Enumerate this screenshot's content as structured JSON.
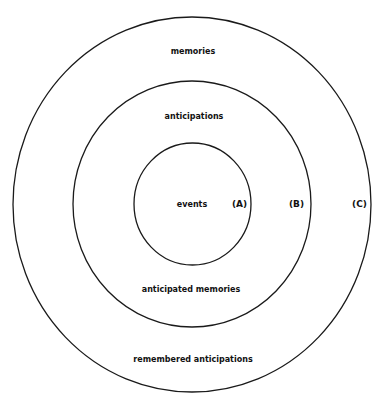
{
  "diagram": {
    "type": "concentric-circles",
    "colors": {
      "stroke": "#1a1a1a",
      "text": "#111111",
      "background": "#ffffff"
    },
    "circles": [
      {
        "id": "A",
        "tag": "(A)",
        "label_inside": "events"
      },
      {
        "id": "B",
        "tag": "(B)",
        "label_top": "anticipations",
        "label_bottom": "anticipated memories"
      },
      {
        "id": "C",
        "tag": "(C)",
        "label_top": "memories",
        "label_bottom": "remembered anticipations"
      }
    ]
  }
}
